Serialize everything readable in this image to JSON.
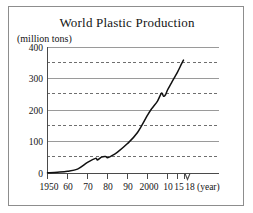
{
  "chart_data": {
    "type": "line",
    "title": "World Plastic Production",
    "ylabel": "(million tons)",
    "xlabel": "(year)",
    "xlim": [
      1950,
      2018
    ],
    "ylim": [
      0,
      400
    ],
    "grid": "horizontal",
    "legend": "none",
    "y_ticks_major": [
      0,
      100,
      200,
      300,
      400
    ],
    "y_ticks_minor": [
      50,
      150,
      250,
      350
    ],
    "y_tick_labels": [
      "0",
      "100",
      "200",
      "300",
      "400"
    ],
    "x_tick_values": [
      1950,
      1960,
      1970,
      1980,
      1990,
      2000,
      2010,
      2015,
      2018
    ],
    "x_tick_labels": [
      "1950",
      "60",
      "70",
      "80",
      "90",
      "2000",
      "10",
      "15",
      "18"
    ],
    "axis_break_after": 2015,
    "series": [
      {
        "name": "World plastic production",
        "x": [
          1950,
          1955,
          1960,
          1965,
          1970,
          1974,
          1975,
          1977,
          1979,
          1980,
          1982,
          1985,
          1990,
          1995,
          2000,
          2002,
          2005,
          2007,
          2008,
          2009,
          2010,
          2012,
          2015,
          2017,
          2018
        ],
        "values": [
          2,
          4,
          7,
          14,
          35,
          48,
          43,
          52,
          54,
          50,
          56,
          68,
          95,
          130,
          185,
          205,
          230,
          255,
          245,
          250,
          265,
          288,
          322,
          348,
          360
        ]
      }
    ]
  },
  "labels": {
    "title": "World Plastic Production",
    "y_unit": "(million tons)",
    "x_unit": "(year)",
    "y0": "0",
    "y100": "100",
    "y200": "200",
    "y300": "300",
    "y400": "400",
    "x1950": "1950",
    "x1960": "60",
    "x1970": "70",
    "x1980": "80",
    "x1990": "90",
    "x2000": "2000",
    "x2010": "10",
    "x2015": "15",
    "x2018": "18"
  }
}
